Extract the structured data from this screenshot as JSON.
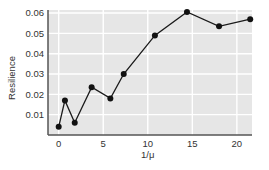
{
  "chart_data": {
    "type": "line",
    "title": "",
    "xlabel": "1/μ",
    "ylabel": "Resilience",
    "xlim": [
      -1.2,
      21.7
    ],
    "ylim": [
      0.0,
      0.0615
    ],
    "xticks": [
      0,
      5,
      10,
      15,
      20
    ],
    "xtick_labels": [
      "0",
      "5",
      "10",
      "15",
      "20"
    ],
    "yticks": [
      0.01,
      0.02,
      0.03,
      0.04,
      0.05,
      0.06
    ],
    "ytick_labels": [
      "0.01",
      "0.02",
      "0.03",
      "0.04",
      "0.05",
      "0.06"
    ],
    "grid": true,
    "legend": null,
    "series": [
      {
        "name": "Resilience",
        "x": [
          0.0,
          0.7,
          1.8,
          3.7,
          5.8,
          7.3,
          10.8,
          14.4,
          18.0,
          21.5
        ],
        "values": [
          0.004,
          0.017,
          0.006,
          0.0235,
          0.018,
          0.03,
          0.049,
          0.0605,
          0.0535,
          0.057
        ]
      }
    ],
    "colors": {
      "plot_background": "#e6e6e6",
      "grid": "#ffffff",
      "line": "#1a1a1a",
      "marker": "#111111",
      "axis": "#555555"
    }
  }
}
